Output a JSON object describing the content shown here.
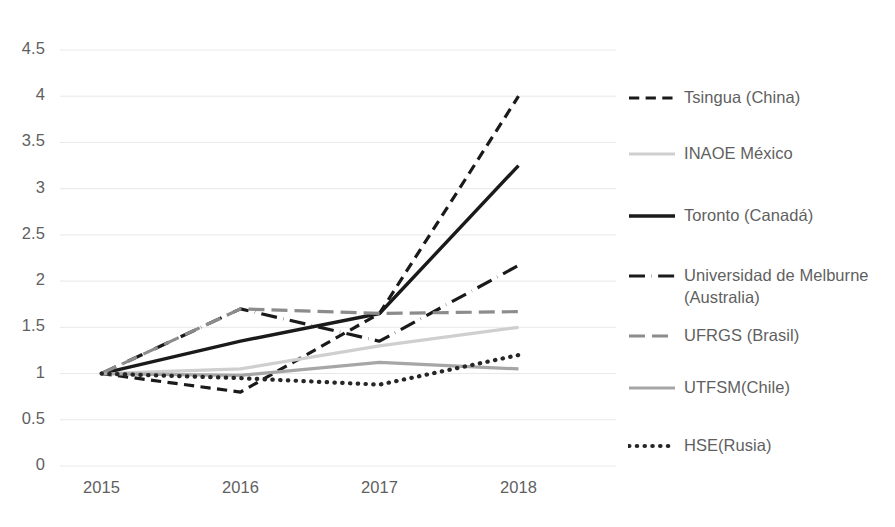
{
  "chart_data": {
    "type": "line",
    "title": "",
    "subtitle": "",
    "xlabel": "",
    "ylabel": "",
    "categories": [
      "2015",
      "2016",
      "2017",
      "2018"
    ],
    "x_tick_labels": [
      "2015",
      "2016",
      "2017",
      "2018"
    ],
    "y_tick_labels": [
      "0",
      "0.5",
      "1",
      "1.5",
      "2",
      "2.5",
      "3",
      "3.5",
      "4",
      "4.5"
    ],
    "y_tick_values": [
      0,
      0.5,
      1,
      1.5,
      2,
      2.5,
      3,
      3.5,
      4,
      4.5
    ],
    "ylim": [
      0,
      4.5
    ],
    "grid": "horizontal",
    "legend_position": "right",
    "series": [
      {
        "name": "Tsingua (China)",
        "values": [
          1,
          0.8,
          1.65,
          4
        ],
        "color": "#1a1a1a",
        "style": "dashed",
        "width": 3.2
      },
      {
        "name": "INAOE México",
        "values": [
          1,
          1.05,
          1.3,
          1.5
        ],
        "color": "#cfcfcf",
        "style": "solid",
        "width": 3.2
      },
      {
        "name": "Toronto (Canadá)",
        "values": [
          1,
          1.35,
          1.65,
          3.25
        ],
        "color": "#1a1a1a",
        "style": "solid",
        "width": 3.4
      },
      {
        "name": "Universidad de Melburne (Australia)",
        "values": [
          1,
          1.7,
          1.35,
          2.17
        ],
        "color": "#1a1a1a",
        "style": "dash-dot",
        "width": 3.2
      },
      {
        "name": "UFRGS (Brasil)",
        "values": [
          1,
          1.7,
          1.65,
          1.67
        ],
        "color": "#8c8c8c",
        "style": "long-dash",
        "width": 3.2
      },
      {
        "name": "UTFSM(Chile)",
        "values": [
          1,
          0.98,
          1.12,
          1.05
        ],
        "color": "#a6a6a6",
        "style": "solid",
        "width": 3.2
      },
      {
        "name": "HSE(Rusia)",
        "values": [
          1,
          0.95,
          0.88,
          1.2
        ],
        "color": "#262626",
        "style": "dotted",
        "width": 4.2
      }
    ]
  },
  "legend": {
    "items": [
      {
        "label": "Tsingua (China)",
        "swatch": "dashed-black-line-icon"
      },
      {
        "label": "INAOE México",
        "swatch": "solid-lightgray-line-icon"
      },
      {
        "label": "Toronto (Canadá)",
        "swatch": "solid-black-line-icon"
      },
      {
        "label": "Universidad de Melburne (Australia)",
        "swatch": "dashdot-black-line-icon"
      },
      {
        "label": "UFRGS (Brasil)",
        "swatch": "dashed-gray-line-icon"
      },
      {
        "label": "UTFSM(Chile)",
        "swatch": "solid-gray-line-icon"
      },
      {
        "label": "HSE(Rusia)",
        "swatch": "dotted-black-line-icon"
      }
    ]
  },
  "colors": {
    "gridline": "#e8e8e8",
    "tick_text": "#5f5f5f",
    "background": "#ffffff"
  }
}
